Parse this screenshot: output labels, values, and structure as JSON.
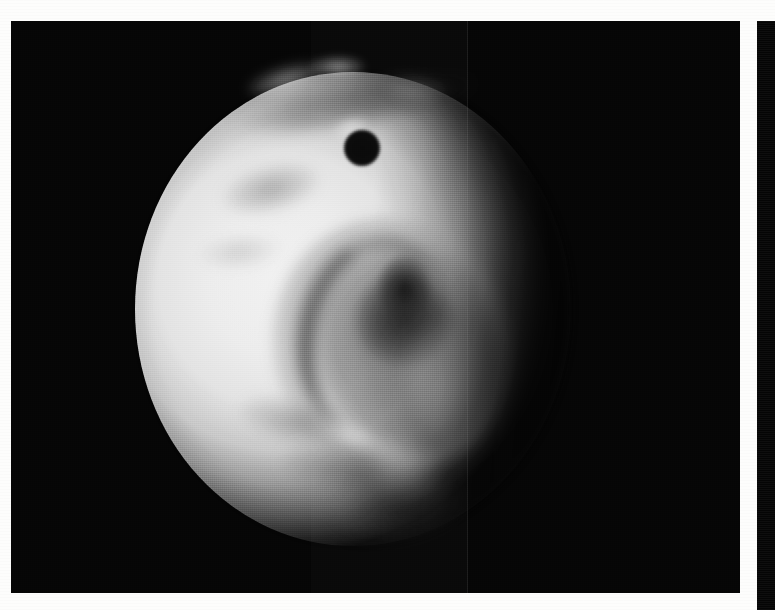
{
  "plate": {
    "background_color": "#fdfdfc",
    "frame_color": "#050505",
    "title": "Grayscale spacecraft image of a cratered icy moon",
    "panels": [
      {
        "name": "main-image-panel",
        "x": 11,
        "y": 21,
        "width": 729,
        "height": 572,
        "background_color": "#050505"
      },
      {
        "name": "side-image-panel",
        "x": 757,
        "y": 21,
        "width": 18,
        "height": 589,
        "background_color": "#050505"
      }
    ]
  },
  "subject": {
    "kind": "moon-disk",
    "description": "Bright, heavily cratered icy satellite, partially illuminated; terminator on the right limb",
    "disk": {
      "center_x": 342,
      "center_y": 288,
      "radius_x": 218,
      "radius_y": 237,
      "highlight_color": "#f2f2f2",
      "midtone_color": "#c9c9c9",
      "shadow_color": "#0a0a0a"
    },
    "features": [
      {
        "name": "dark-crater-spot",
        "label": "Small dark circular crater",
        "center_x": 361,
        "center_y": 148,
        "radius": 18,
        "tone": "#050505"
      },
      {
        "name": "impact-basin",
        "label": "Large degraded impact basin",
        "center_x": 397,
        "center_y": 344,
        "radius_x": 112,
        "radius_y": 124,
        "tone": "#464646"
      },
      {
        "name": "basin-core-shadow",
        "label": "Dark basin floor shadow",
        "center_x": 404,
        "center_y": 319,
        "radius": 46,
        "tone": "#0c0c0c"
      },
      {
        "name": "northern-bright-ridges",
        "label": "Bright ridges along the northern limb",
        "tone": "#ffffff"
      },
      {
        "name": "southern-mottled-terrain",
        "label": "Mottled dark southern terrain",
        "tone": "#2d2d2d"
      },
      {
        "name": "terminator",
        "label": "Day / night terminator on the eastern limb",
        "tone": "#050505"
      }
    ]
  },
  "artifacts": {
    "scanlines": "horizontal raster scan lines",
    "vertical_line": "faint vertical transmission line artifact near x=467",
    "grain": "photographic halftone grain"
  }
}
